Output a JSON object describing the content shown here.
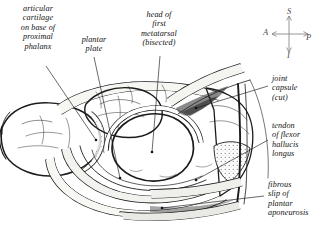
{
  "figure": {
    "background_color": "#ffffff",
    "ink_color": "#1b1b1b"
  },
  "labels": [
    {
      "id": "articular",
      "text": "articular\ncartilage\non base of\nproximal\nphalanx",
      "align": "center"
    },
    {
      "id": "plantar",
      "text": "plantar\nplate",
      "align": "center"
    },
    {
      "id": "head",
      "text": "head of\nfirst\nmetatarsal\n(bisected)",
      "align": "center"
    },
    {
      "id": "joint",
      "text": "joint\ncapsule\n(cut)",
      "align": "left"
    },
    {
      "id": "tendon",
      "text": "tendon\nof flexor\nhallucis\nlongus",
      "align": "left"
    },
    {
      "id": "fibrous",
      "text": "fibrous\nslip of\nplantar\naponeurosis",
      "align": "left"
    }
  ],
  "compass": {
    "superior": "S",
    "inferior": "I",
    "anterior": "A",
    "posterior": "P",
    "color": "#4a4a4a"
  }
}
